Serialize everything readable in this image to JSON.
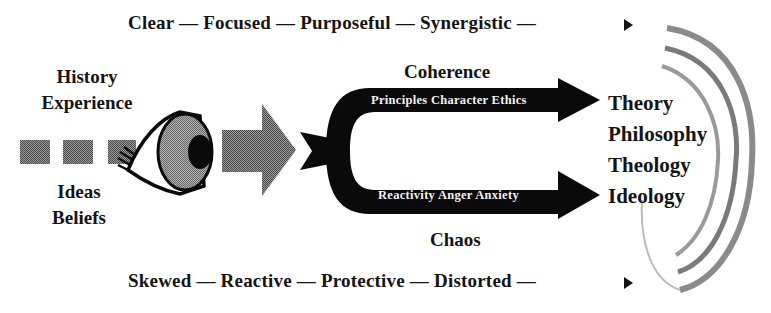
{
  "diagram": {
    "top_flow": {
      "steps": [
        "Clear",
        "Focused",
        "Purposeful",
        "Synergistic"
      ],
      "separator": "—",
      "end_marker": "arrow-right"
    },
    "bottom_flow": {
      "steps": [
        "Skewed",
        "Reactive",
        "Protective",
        "Distorted"
      ],
      "separator": "—",
      "end_marker": "arrow-right"
    },
    "inputs_above": [
      "History",
      "Experience"
    ],
    "inputs_below": [
      "Ideas",
      "Beliefs"
    ],
    "upper_branch": {
      "label": "Coherence",
      "arrow_text": "Principles Character Ethics"
    },
    "lower_branch": {
      "label": "Chaos",
      "arrow_text": "Reactivity Anger Anxiety"
    },
    "outputs": [
      "Theory",
      "Philosophy",
      "Theology",
      "Ideology"
    ],
    "icons": {
      "eye": "eye-icon",
      "lens_arrow": "gray-arrow-icon",
      "fork": "fork-arrow-icon",
      "rings": "concentric-rings-icon"
    },
    "colors": {
      "text": "#141414",
      "black_arrow": "#0a0a0a",
      "gray_fill": "#6e6e6e",
      "iris_fill": "#8a8a8a",
      "ring": "#7a7a7a"
    }
  }
}
